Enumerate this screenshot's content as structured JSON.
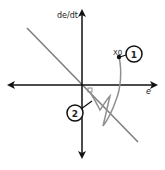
{
  "diagram": {
    "type": "phase-plane",
    "axes": {
      "y_label": "de/dt",
      "x_label": "e"
    },
    "points": [
      {
        "label": "X0",
        "marker": "1"
      }
    ],
    "markers": [
      {
        "id": "1",
        "label": "1"
      },
      {
        "id": "2",
        "label": "2"
      }
    ],
    "colors": {
      "axis": "#111111",
      "switching_line": "#808080",
      "trajectory": "#909090"
    }
  }
}
